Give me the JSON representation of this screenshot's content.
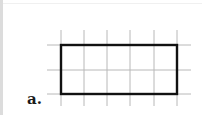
{
  "figure": {
    "label": "a.",
    "grid": {
      "columns_x": [
        61,
        84,
        107,
        130,
        154,
        177
      ],
      "rows_y": [
        45,
        70,
        94
      ],
      "vertical_extent": [
        30,
        106
      ],
      "horizontal_extent": [
        47,
        191
      ],
      "line_color": "#b8b8b8"
    },
    "rectangle": {
      "x": 61,
      "y": 45,
      "width": 116,
      "height": 49,
      "grid_units_wide": 5,
      "grid_units_high": 2,
      "stroke_color": "#111111"
    }
  }
}
